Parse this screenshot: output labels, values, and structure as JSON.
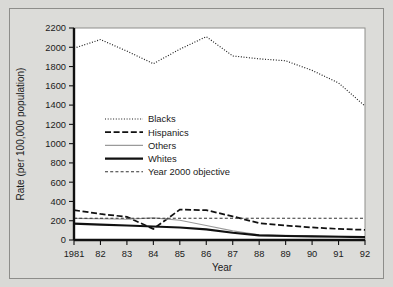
{
  "figure": {
    "background_color": "#d9d9d6",
    "plot_background_color": "#ffffff",
    "border_color": "#8d8d8a"
  },
  "chart_data": {
    "type": "line",
    "title": "",
    "xlabel": "Year",
    "ylabel": "Rate (per 100,000 population)",
    "x": [
      1981,
      1982,
      1983,
      1984,
      1985,
      1986,
      1987,
      1988,
      1989,
      1990,
      1991,
      1992
    ],
    "xtick_labels": [
      "1981",
      "82",
      "83",
      "84",
      "85",
      "86",
      "87",
      "88",
      "89",
      "90",
      "91",
      "92"
    ],
    "ytick_labels": [
      "0",
      "200",
      "400",
      "600",
      "800",
      "1000",
      "1200",
      "1400",
      "1600",
      "1800",
      "2000",
      "2200"
    ],
    "ytick_values": [
      0,
      200,
      400,
      600,
      800,
      1000,
      1200,
      1400,
      1600,
      1800,
      2000,
      2200
    ],
    "ylim": [
      0,
      2200
    ],
    "xlim": [
      1981,
      1992
    ],
    "grid": false,
    "legend_position": "upper-left-inside",
    "series": [
      {
        "name": "Blacks",
        "style": "dotted",
        "color": "#1a1a1a",
        "values": [
          1990,
          2080,
          1960,
          1830,
          1980,
          2110,
          1910,
          1880,
          1860,
          1760,
          1630,
          1390
        ]
      },
      {
        "name": "Hispanics",
        "style": "dash-dot",
        "color": "#111111",
        "values": [
          310,
          270,
          240,
          115,
          315,
          310,
          245,
          175,
          150,
          130,
          115,
          105
        ]
      },
      {
        "name": "Others",
        "style": "solid-thin",
        "color": "#9a9a9a",
        "values": [
          225,
          220,
          215,
          230,
          205,
          150,
          95,
          55,
          48,
          42,
          38,
          35
        ]
      },
      {
        "name": "Whites",
        "style": "solid-thick",
        "color": "#111111",
        "values": [
          170,
          160,
          150,
          140,
          130,
          110,
          75,
          48,
          42,
          38,
          34,
          30
        ]
      },
      {
        "name": "Year 2000 objective",
        "style": "dashed",
        "color": "#333333",
        "values": [
          225,
          225,
          225,
          225,
          225,
          225,
          225,
          225,
          225,
          225,
          225,
          225
        ]
      }
    ]
  }
}
